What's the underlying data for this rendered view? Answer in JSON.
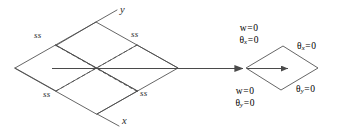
{
  "figure": {
    "stroke_color": "#4a4a4a",
    "text_color": "#2b2b2b",
    "background_color": "#ffffff"
  },
  "plate": {
    "name": "simply-supported-plate",
    "edge_labels": [
      {
        "id": "ss-top-left",
        "text": "ss"
      },
      {
        "id": "ss-top-right",
        "text": "ss"
      },
      {
        "id": "ss-bottom-left",
        "text": "ss"
      },
      {
        "id": "ss-bottom-right",
        "text": "ss"
      }
    ],
    "axes": [
      {
        "id": "axis-y",
        "text": "y"
      },
      {
        "id": "axis-x",
        "text": "x"
      }
    ]
  },
  "detail": {
    "name": "boundary-condition-detail",
    "conditions": {
      "top_left": {
        "line1": {
          "sym": "w",
          "eq": "=",
          "val": "0"
        },
        "line2": {
          "sym": "θ",
          "sub": "x",
          "eq": "=",
          "val": "0"
        }
      },
      "bottom_left": {
        "line1": {
          "sym": "w",
          "eq": "=",
          "val": "0"
        },
        "line2": {
          "sym": "θ",
          "sub": "y",
          "eq": "=",
          "val": "0"
        }
      },
      "top_right": {
        "line1": {
          "sym": "θ",
          "sub": "x",
          "eq": "=",
          "val": "0"
        }
      },
      "bottom_right": {
        "line1": {
          "sym": "θ",
          "sub": "y",
          "eq": "=",
          "val": "0"
        }
      }
    }
  }
}
